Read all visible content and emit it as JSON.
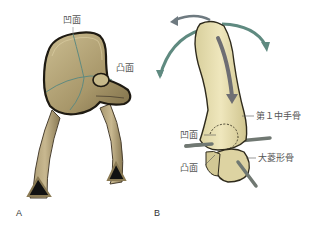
{
  "figure": {
    "panel_a": {
      "label": "A",
      "annotations": {
        "concave": "凹面",
        "convex": "凸面"
      }
    },
    "panel_b": {
      "label": "B",
      "annotations": {
        "metacarpal": "第１中手骨",
        "concave": "凹面",
        "convex": "凸面",
        "trapezium": "大菱形骨"
      }
    }
  },
  "colors": {
    "saddle_fill": "#b8a77a",
    "saddle_outline": "#2a2418",
    "bone_fill": "#e8dfae",
    "bone_outline": "#3a3524",
    "arrow_teal": "#5f8a80",
    "arrow_gray": "#6e6e73",
    "axis_rod": "#707872"
  }
}
